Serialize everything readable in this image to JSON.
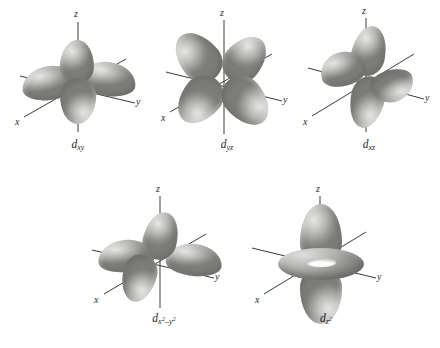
{
  "figure": {
    "background_color": "#ffffff",
    "lobe_color_light": "#e6e6e4",
    "lobe_color_mid": "#b9b9b6",
    "lobe_color_dark": "#7c7c79",
    "axis_color": "#3b3b3b"
  },
  "orbitals": [
    {
      "id": "dxy",
      "label_base": "d",
      "label_sub": "xy",
      "axis_labels": {
        "z": "z",
        "x": "x",
        "y": "y"
      },
      "plane": "xy",
      "lobe_count": 4,
      "has_torus": false
    },
    {
      "id": "dyz",
      "label_base": "d",
      "label_sub": "yz",
      "axis_labels": {
        "z": "z",
        "x": "x",
        "y": "y"
      },
      "plane": "yz",
      "lobe_count": 4,
      "has_torus": false
    },
    {
      "id": "dxz",
      "label_base": "d",
      "label_sub": "xz",
      "axis_labels": {
        "z": "z",
        "x": "x",
        "y": "y"
      },
      "plane": "xz",
      "lobe_count": 4,
      "has_torus": false
    },
    {
      "id": "dx2y2",
      "label_base": "d",
      "label_sub_x": "x",
      "label_sup_1": "2",
      "label_minus": "–",
      "label_sub_y": "y",
      "label_sup_2": "2",
      "axis_labels": {
        "z": "z",
        "x": "x",
        "y": "y"
      },
      "plane": "xy-axial",
      "lobe_count": 4,
      "has_torus": false
    },
    {
      "id": "dz2",
      "label_base": "d",
      "label_sub_z": "z",
      "label_sup": "2",
      "axis_labels": {
        "z": "z",
        "x": "x",
        "y": "y"
      },
      "plane": "z-axial",
      "lobe_count": 2,
      "has_torus": true
    }
  ]
}
